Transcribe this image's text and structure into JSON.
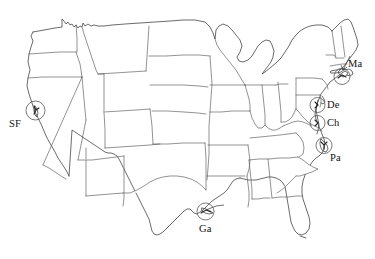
{
  "map": {
    "title": "United States outline map with circled coastal site markers",
    "background_color": "#ffffff",
    "outline_color": "#3a3a3a",
    "state_border_color": "#4a4a4a",
    "marker_circle_color": "#555555",
    "label_color": "#111111",
    "projection_note": "contiguous United States, state boundaries shown",
    "markers": [
      {
        "id": "sf",
        "label": "SF",
        "name": "marker-sf",
        "circle": {
          "cx": 35.5,
          "cy": 110.5,
          "r": 9.5
        },
        "label_x": 9,
        "label_y": 119,
        "region": "San Francisco Bay, California"
      },
      {
        "id": "ga",
        "label": "Ga",
        "name": "marker-ga",
        "circle": {
          "cx": 205.5,
          "cy": 211.5,
          "r": 8.5
        },
        "label_x": 199,
        "label_y": 224,
        "region": "Galveston, Texas Gulf coast"
      },
      {
        "id": "ma",
        "label": "Ma",
        "name": "marker-ma",
        "circle": {
          "cx": 342.0,
          "cy": 76.5,
          "r": 8.0
        },
        "label_x": 348,
        "label_y": 59,
        "region": "Massachusetts, Cape Cod"
      },
      {
        "id": "de",
        "label": "De",
        "name": "marker-de",
        "circle": {
          "cx": 317.5,
          "cy": 105.0,
          "r": 7.5
        },
        "label_x": 327,
        "label_y": 100,
        "region": "Delaware Bay"
      },
      {
        "id": "ch",
        "label": "Ch",
        "name": "marker-ch",
        "circle": {
          "cx": 317.5,
          "cy": 123.0,
          "r": 7.5
        },
        "label_x": 327,
        "label_y": 118,
        "region": "Chesapeake Bay"
      },
      {
        "id": "pa",
        "label": "Pa",
        "name": "marker-pa",
        "circle": {
          "cx": 324.0,
          "cy": 145.5,
          "r": 8.0
        },
        "label_x": 330,
        "label_y": 153,
        "region": "Pamlico Sound, North Carolina"
      }
    ]
  }
}
